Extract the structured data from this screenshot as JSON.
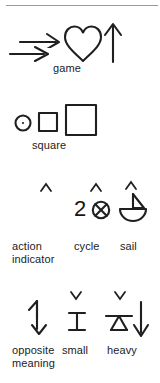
{
  "page": {
    "background": "#ffffff",
    "ink_color": "#1f1f1f",
    "rule_color": "#9a9a9a"
  },
  "groups": [
    {
      "id": "group-game",
      "caption": "game",
      "symbols": [
        {
          "name": "right-arrow-upper",
          "glyph": "→"
        },
        {
          "name": "right-arrow-lower",
          "glyph": "→"
        },
        {
          "name": "heart",
          "glyph": "♡"
        },
        {
          "name": "up-arrow",
          "glyph": "↑"
        }
      ]
    },
    {
      "id": "group-square",
      "caption": "square",
      "symbols": [
        {
          "name": "circle-with-dot",
          "glyph": "⊙"
        },
        {
          "name": "small-square",
          "glyph": "□"
        },
        {
          "name": "large-square",
          "glyph": "□"
        }
      ]
    },
    {
      "id": "group-action-indicator",
      "caption": "action\nindicator",
      "symbols": [
        {
          "name": "caret-up-mark",
          "glyph": "ʌ"
        }
      ]
    },
    {
      "id": "group-cycle",
      "caption": "cycle",
      "value": "2",
      "symbols": [
        {
          "name": "caret-up-mark",
          "glyph": "ʌ"
        },
        {
          "name": "digit-two",
          "glyph": "2"
        },
        {
          "name": "circled-x",
          "glyph": "⊗"
        }
      ]
    },
    {
      "id": "group-sail",
      "caption": "sail",
      "symbols": [
        {
          "name": "caret-up-mark",
          "glyph": "ʌ"
        },
        {
          "name": "sailboat",
          "glyph": "⛵"
        }
      ]
    },
    {
      "id": "group-opposite-meaning",
      "caption": "opposite\nmeaning",
      "symbols": [
        {
          "name": "up-down-zigzag-arrow",
          "glyph": "⇅"
        }
      ]
    },
    {
      "id": "group-small",
      "caption": "small",
      "symbols": [
        {
          "name": "caret-down-mark",
          "glyph": "∨"
        },
        {
          "name": "i-beam",
          "glyph": "I"
        }
      ]
    },
    {
      "id": "group-heavy",
      "caption": "heavy",
      "symbols": [
        {
          "name": "caret-down-mark",
          "glyph": "∨"
        },
        {
          "name": "balance-fulcrum",
          "glyph": "△"
        },
        {
          "name": "down-arrow",
          "glyph": "↓"
        }
      ]
    }
  ],
  "captions": {
    "game": "game",
    "square": "square",
    "action_indicator": "action\nindicator",
    "cycle": "cycle",
    "sail": "sail",
    "opposite_meaning": "opposite\nmeaning",
    "small": "small",
    "heavy": "heavy",
    "cycle_number": "2"
  }
}
